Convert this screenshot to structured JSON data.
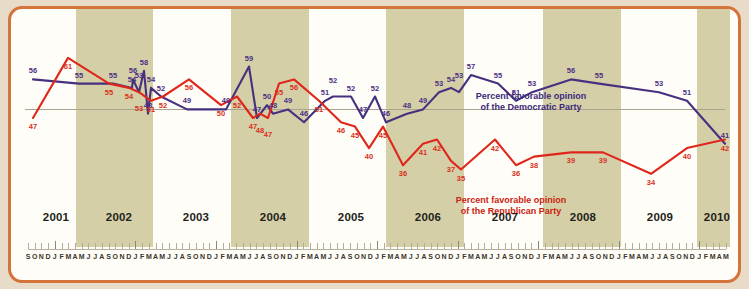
{
  "chart_data": {
    "type": "line",
    "title": "",
    "xlabel": "",
    "ylabel": "",
    "ylim": [
      30,
      64
    ],
    "grid": false,
    "legend_position": "inline-annotations",
    "annotations": [
      "Percent favorable opinion of the Democratic Party",
      "Percent favorable opinion of the Republican Party"
    ],
    "year_labels": [
      "2001",
      "2002",
      "2003",
      "2004",
      "2005",
      "2006",
      "2007",
      "2008",
      "2009",
      "2010"
    ],
    "month_ticks": "S O N D J F M A M J J A S O N D J F M A M J J A S O N D J F M A M J J A S O N D J F M A M J J A S O N D J F M A M J J A S O N D J F M A M J J A S O N D J F M A M J J A S O N D J F M A M",
    "series": [
      {
        "name": "Percent favorable opinion of the Democratic Party",
        "color": "#46307f",
        "label_color": "#4b2f84",
        "points": [
          {
            "x": 22,
            "value": 56
          },
          {
            "x": 68,
            "value": 55
          },
          {
            "x": 102,
            "value": 55
          },
          {
            "x": 122,
            "value": 56
          },
          {
            "x": 133,
            "value": 58
          },
          {
            "x": 140,
            "value": 54
          },
          {
            "x": 150,
            "value": 52
          },
          {
            "x": 121,
            "value": 54
          },
          {
            "x": 128,
            "value": 53
          },
          {
            "x": 137,
            "value": 48
          },
          {
            "x": 176,
            "value": 49
          },
          {
            "x": 215,
            "value": 49
          },
          {
            "x": 238,
            "value": 59
          },
          {
            "x": 246,
            "value": 47
          },
          {
            "x": 256,
            "value": 50
          },
          {
            "x": 262,
            "value": 48
          },
          {
            "x": 277,
            "value": 49
          },
          {
            "x": 293,
            "value": 46
          },
          {
            "x": 314,
            "value": 51
          },
          {
            "x": 322,
            "value": 52
          },
          {
            "x": 340,
            "value": 52
          },
          {
            "x": 352,
            "value": 47
          },
          {
            "x": 364,
            "value": 52
          },
          {
            "x": 375,
            "value": 46
          },
          {
            "x": 396,
            "value": 48
          },
          {
            "x": 412,
            "value": 49
          },
          {
            "x": 428,
            "value": 53
          },
          {
            "x": 440,
            "value": 54
          },
          {
            "x": 448,
            "value": 53
          },
          {
            "x": 460,
            "value": 57
          },
          {
            "x": 487,
            "value": 55
          },
          {
            "x": 505,
            "value": 51
          },
          {
            "x": 521,
            "value": 53
          },
          {
            "x": 560,
            "value": 56
          },
          {
            "x": 588,
            "value": 55
          },
          {
            "x": 648,
            "value": 53
          },
          {
            "x": 676,
            "value": 51
          },
          {
            "x": 714,
            "value": 41
          }
        ]
      },
      {
        "name": "Percent favorable opinion of the Republican Party",
        "color": "#e0251a",
        "label_color": "#d8311b",
        "points": [
          {
            "x": 22,
            "value": 47
          },
          {
            "x": 57,
            "value": 61
          },
          {
            "x": 98,
            "value": 55
          },
          {
            "x": 118,
            "value": 54
          },
          {
            "x": 128,
            "value": 53
          },
          {
            "x": 140,
            "value": 51
          },
          {
            "x": 152,
            "value": 52
          },
          {
            "x": 178,
            "value": 56
          },
          {
            "x": 210,
            "value": 50
          },
          {
            "x": 226,
            "value": 52
          },
          {
            "x": 242,
            "value": 47
          },
          {
            "x": 249,
            "value": 48
          },
          {
            "x": 257,
            "value": 47
          },
          {
            "x": 268,
            "value": 55
          },
          {
            "x": 283,
            "value": 56
          },
          {
            "x": 308,
            "value": 51
          },
          {
            "x": 330,
            "value": 46
          },
          {
            "x": 344,
            "value": 45
          },
          {
            "x": 358,
            "value": 40
          },
          {
            "x": 372,
            "value": 45
          },
          {
            "x": 392,
            "value": 36
          },
          {
            "x": 412,
            "value": 41
          },
          {
            "x": 426,
            "value": 42
          },
          {
            "x": 440,
            "value": 37
          },
          {
            "x": 450,
            "value": 35
          },
          {
            "x": 484,
            "value": 42
          },
          {
            "x": 505,
            "value": 36
          },
          {
            "x": 523,
            "value": 38
          },
          {
            "x": 560,
            "value": 39
          },
          {
            "x": 592,
            "value": 39
          },
          {
            "x": 640,
            "value": 34
          },
          {
            "x": 676,
            "value": 40
          },
          {
            "x": 714,
            "value": 42
          }
        ]
      }
    ]
  },
  "legends": {
    "democratic_line1": "Percent favorable opinion",
    "democratic_line2": "of the Democratic Party",
    "republican_line1": "Percent favorable opinion",
    "republican_line2": "of the Republican Party"
  },
  "years": [
    {
      "label": "2001",
      "x": 45
    },
    {
      "label": "2002",
      "x": 108
    },
    {
      "label": "2003",
      "x": 185
    },
    {
      "label": "2004",
      "x": 262
    },
    {
      "label": "2005",
      "x": 340
    },
    {
      "label": "2006",
      "x": 417
    },
    {
      "label": "2007",
      "x": 494
    },
    {
      "label": "2008",
      "x": 572
    },
    {
      "label": "2009",
      "x": 649
    },
    {
      "label": "2010",
      "x": 706
    }
  ],
  "bands": [
    {
      "x": 65,
      "w": 77
    },
    {
      "x": 220,
      "w": 78
    },
    {
      "x": 375,
      "w": 78
    },
    {
      "x": 532,
      "w": 78
    },
    {
      "x": 686,
      "w": 33
    }
  ],
  "months": [
    "S",
    "O",
    "N",
    "D",
    "J",
    "F",
    "M",
    "A",
    "M",
    "J",
    "J",
    "A",
    "S",
    "O",
    "N",
    "D",
    "J",
    "F",
    "M",
    "A",
    "M",
    "J",
    "J",
    "A",
    "S",
    "O",
    "N",
    "D",
    "J",
    "F",
    "M",
    "A",
    "M",
    "J",
    "J",
    "A",
    "S",
    "O",
    "N",
    "D",
    "J",
    "F",
    "M",
    "A",
    "M",
    "J",
    "J",
    "A",
    "S",
    "O",
    "N",
    "D",
    "J",
    "F",
    "M",
    "A",
    "M",
    "J",
    "J",
    "A",
    "S",
    "O",
    "N",
    "D",
    "J",
    "F",
    "M",
    "A",
    "M",
    "J",
    "J",
    "A",
    "S",
    "O",
    "N",
    "D",
    "J",
    "F",
    "M",
    "A",
    "M",
    "J",
    "J",
    "A",
    "S",
    "O",
    "N",
    "D",
    "J",
    "F",
    "M",
    "A",
    "M",
    "J",
    "J",
    "A",
    "S",
    "O",
    "N",
    "D",
    "J",
    "F",
    "M",
    "A",
    "M"
  ],
  "colors": {
    "page_background": "#e8dcc8",
    "frame_border": "#d4733a",
    "plot_background": "#fffdf7",
    "band_shade": "#d5cfa8",
    "democratic": "#46307f",
    "republican": "#e0251a",
    "axis": "#b9b1a0"
  }
}
